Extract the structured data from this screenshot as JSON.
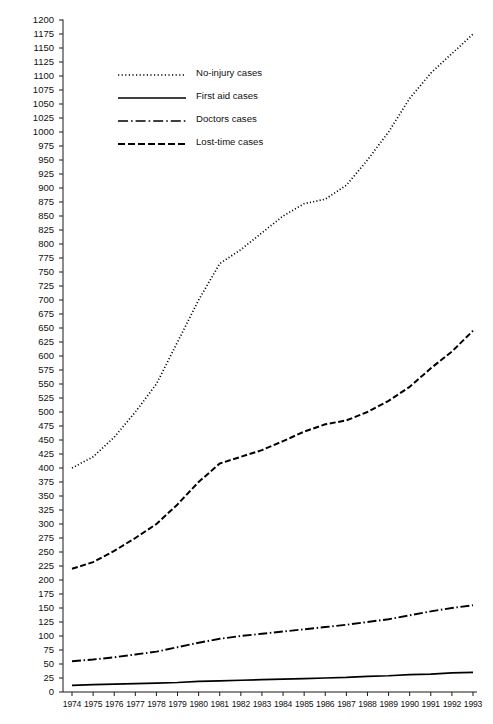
{
  "chart_data": {
    "type": "line",
    "title": "",
    "xlabel": "",
    "ylabel": "",
    "grid": false,
    "legend_position": "upper-left-inside",
    "x": [
      1974,
      1975,
      1976,
      1977,
      1978,
      1979,
      1980,
      1981,
      1982,
      1983,
      1984,
      1985,
      1986,
      1987,
      1988,
      1989,
      1990,
      1991,
      1992,
      1993
    ],
    "categories": [
      "1974",
      "1975",
      "1976",
      "1977",
      "1978",
      "1979",
      "1980",
      "1981",
      "1982",
      "1983",
      "1984",
      "1985",
      "1986",
      "1987",
      "1988",
      "1989",
      "1990",
      "1991",
      "1992",
      "1993"
    ],
    "xlim": [
      1974,
      1993
    ],
    "ylim": [
      0,
      1200
    ],
    "ytick_step": 25,
    "yticks": [
      0,
      25,
      50,
      75,
      100,
      125,
      150,
      175,
      200,
      225,
      250,
      275,
      300,
      325,
      350,
      375,
      400,
      425,
      450,
      475,
      500,
      525,
      550,
      575,
      600,
      625,
      650,
      675,
      700,
      725,
      750,
      775,
      800,
      825,
      850,
      875,
      900,
      925,
      950,
      975,
      1000,
      1025,
      1050,
      1075,
      1100,
      1125,
      1150,
      1175,
      1200
    ],
    "series": [
      {
        "name": "No-injury cases",
        "style": "dotted",
        "color": "#000000",
        "values": [
          400,
          420,
          455,
          500,
          550,
          625,
          700,
          765,
          790,
          820,
          850,
          872,
          880,
          905,
          950,
          1000,
          1060,
          1105,
          1140,
          1175
        ]
      },
      {
        "name": "First aid cases",
        "style": "solid",
        "color": "#000000",
        "values": [
          12,
          13,
          14,
          15,
          16,
          17,
          19,
          20,
          21,
          22,
          23,
          24,
          25,
          26,
          28,
          29,
          31,
          32,
          34,
          35
        ]
      },
      {
        "name": "Doctors cases",
        "style": "dashdot",
        "color": "#000000",
        "values": [
          55,
          58,
          62,
          67,
          72,
          80,
          88,
          95,
          100,
          104,
          108,
          112,
          116,
          120,
          125,
          130,
          137,
          144,
          150,
          155
        ]
      },
      {
        "name": "Lost-time cases",
        "style": "dashed",
        "color": "#000000",
        "values": [
          220,
          232,
          252,
          275,
          300,
          335,
          375,
          408,
          420,
          432,
          448,
          465,
          478,
          485,
          500,
          520,
          545,
          578,
          608,
          645
        ]
      }
    ]
  },
  "legend": {
    "items": [
      {
        "label": "No-injury cases",
        "style": "dotted"
      },
      {
        "label": "First aid cases",
        "style": "solid"
      },
      {
        "label": "Doctors cases",
        "style": "dashdot"
      },
      {
        "label": "Lost-time cases",
        "style": "dashed"
      }
    ]
  },
  "axis": {
    "axis_color": "#1a1a1a"
  }
}
